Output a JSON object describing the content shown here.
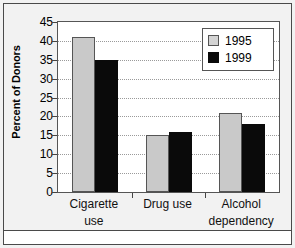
{
  "chart_data": {
    "type": "bar",
    "title": "",
    "xlabel": "",
    "ylabel": "Percent of Donors",
    "ylim": [
      0,
      45
    ],
    "yticks": [
      0,
      5,
      10,
      15,
      20,
      25,
      30,
      35,
      40,
      45
    ],
    "grid": true,
    "legend_position": "top-right",
    "categories": [
      "Cigarette use",
      "Drug use",
      "Alcohol dependency"
    ],
    "category_lines": [
      [
        "Cigarette",
        "use"
      ],
      [
        "Drug use",
        ""
      ],
      [
        "Alcohol",
        "dependency"
      ]
    ],
    "series": [
      {
        "name": "1995",
        "color": "#c9c9c9",
        "values": [
          41,
          15,
          21
        ]
      },
      {
        "name": "1999",
        "color": "#0a0a0a",
        "values": [
          35,
          16,
          18
        ]
      }
    ]
  },
  "legend": {
    "entries": [
      {
        "label": "1995"
      },
      {
        "label": "1999"
      }
    ]
  },
  "axis": {
    "y_title": "Percent of Donors",
    "y_tick_labels": [
      "45",
      "40",
      "35",
      "30",
      "25",
      "20",
      "15",
      "10",
      "5",
      "0"
    ]
  },
  "colors": {
    "series_1995": "#c9c9c9",
    "series_1999": "#0a0a0a",
    "plot_background": "#ffffff",
    "figure_background": "#f2f2f2",
    "frame": "#4a4a4a",
    "gridline": "#9a9a9a"
  }
}
